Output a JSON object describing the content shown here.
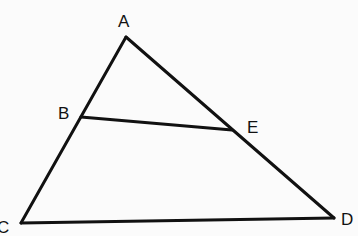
{
  "diagram": {
    "type": "geometry-triangle",
    "points": {
      "A": {
        "label": "A",
        "x": 126,
        "y": 37
      },
      "B": {
        "label": "B",
        "x": 81,
        "y": 117
      },
      "C": {
        "label": "C",
        "x": 21,
        "y": 223
      },
      "D": {
        "label": "D",
        "x": 334,
        "y": 218
      },
      "E": {
        "label": "E",
        "x": 232,
        "y": 130
      }
    },
    "segments": [
      {
        "from": "A",
        "to": "C"
      },
      {
        "from": "A",
        "to": "D"
      },
      {
        "from": "C",
        "to": "D"
      },
      {
        "from": "B",
        "to": "E"
      }
    ],
    "line_color": "#111111",
    "background": "#fbfbfb"
  }
}
